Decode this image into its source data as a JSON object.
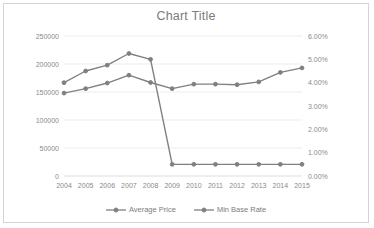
{
  "chart_data": {
    "type": "line",
    "title": "Chart Title",
    "xlabel": "",
    "ylabel": "",
    "grid": true,
    "legend_position": "bottom",
    "categories": [
      "2004",
      "2005",
      "2006",
      "2007",
      "2008",
      "2009",
      "2010",
      "2011",
      "2012",
      "2013",
      "2014",
      "2015"
    ],
    "axes": {
      "left": {
        "ylim": [
          0,
          250000
        ],
        "ticks": [
          "0",
          "50000",
          "100000",
          "150000",
          "200000",
          "250000"
        ],
        "tick_values": [
          0,
          50000,
          100000,
          150000,
          200000,
          250000
        ]
      },
      "right": {
        "ylim": [
          0,
          6
        ],
        "ticks": [
          "0.00%",
          "1.00%",
          "2.00%",
          "3.00%",
          "4.00%",
          "5.00%",
          "6.00%"
        ],
        "tick_values": [
          0,
          1,
          2,
          3,
          4,
          5,
          6
        ]
      }
    },
    "series": [
      {
        "name": "Average Price",
        "axis": "left",
        "color": "#808080",
        "marker": "circle",
        "values": [
          148000,
          156000,
          166000,
          180000,
          167000,
          156000,
          164000,
          164000,
          163000,
          168000,
          185000,
          193000
        ]
      },
      {
        "name": "Min Base Rate",
        "axis": "right",
        "color": "#808080",
        "marker": "circle",
        "values": [
          4.0,
          4.5,
          4.75,
          5.25,
          5.0,
          0.5,
          0.5,
          0.5,
          0.5,
          0.5,
          0.5,
          0.5
        ]
      }
    ]
  },
  "legend": {
    "items": [
      {
        "label": "Average Price"
      },
      {
        "label": "Min Base Rate"
      }
    ]
  }
}
